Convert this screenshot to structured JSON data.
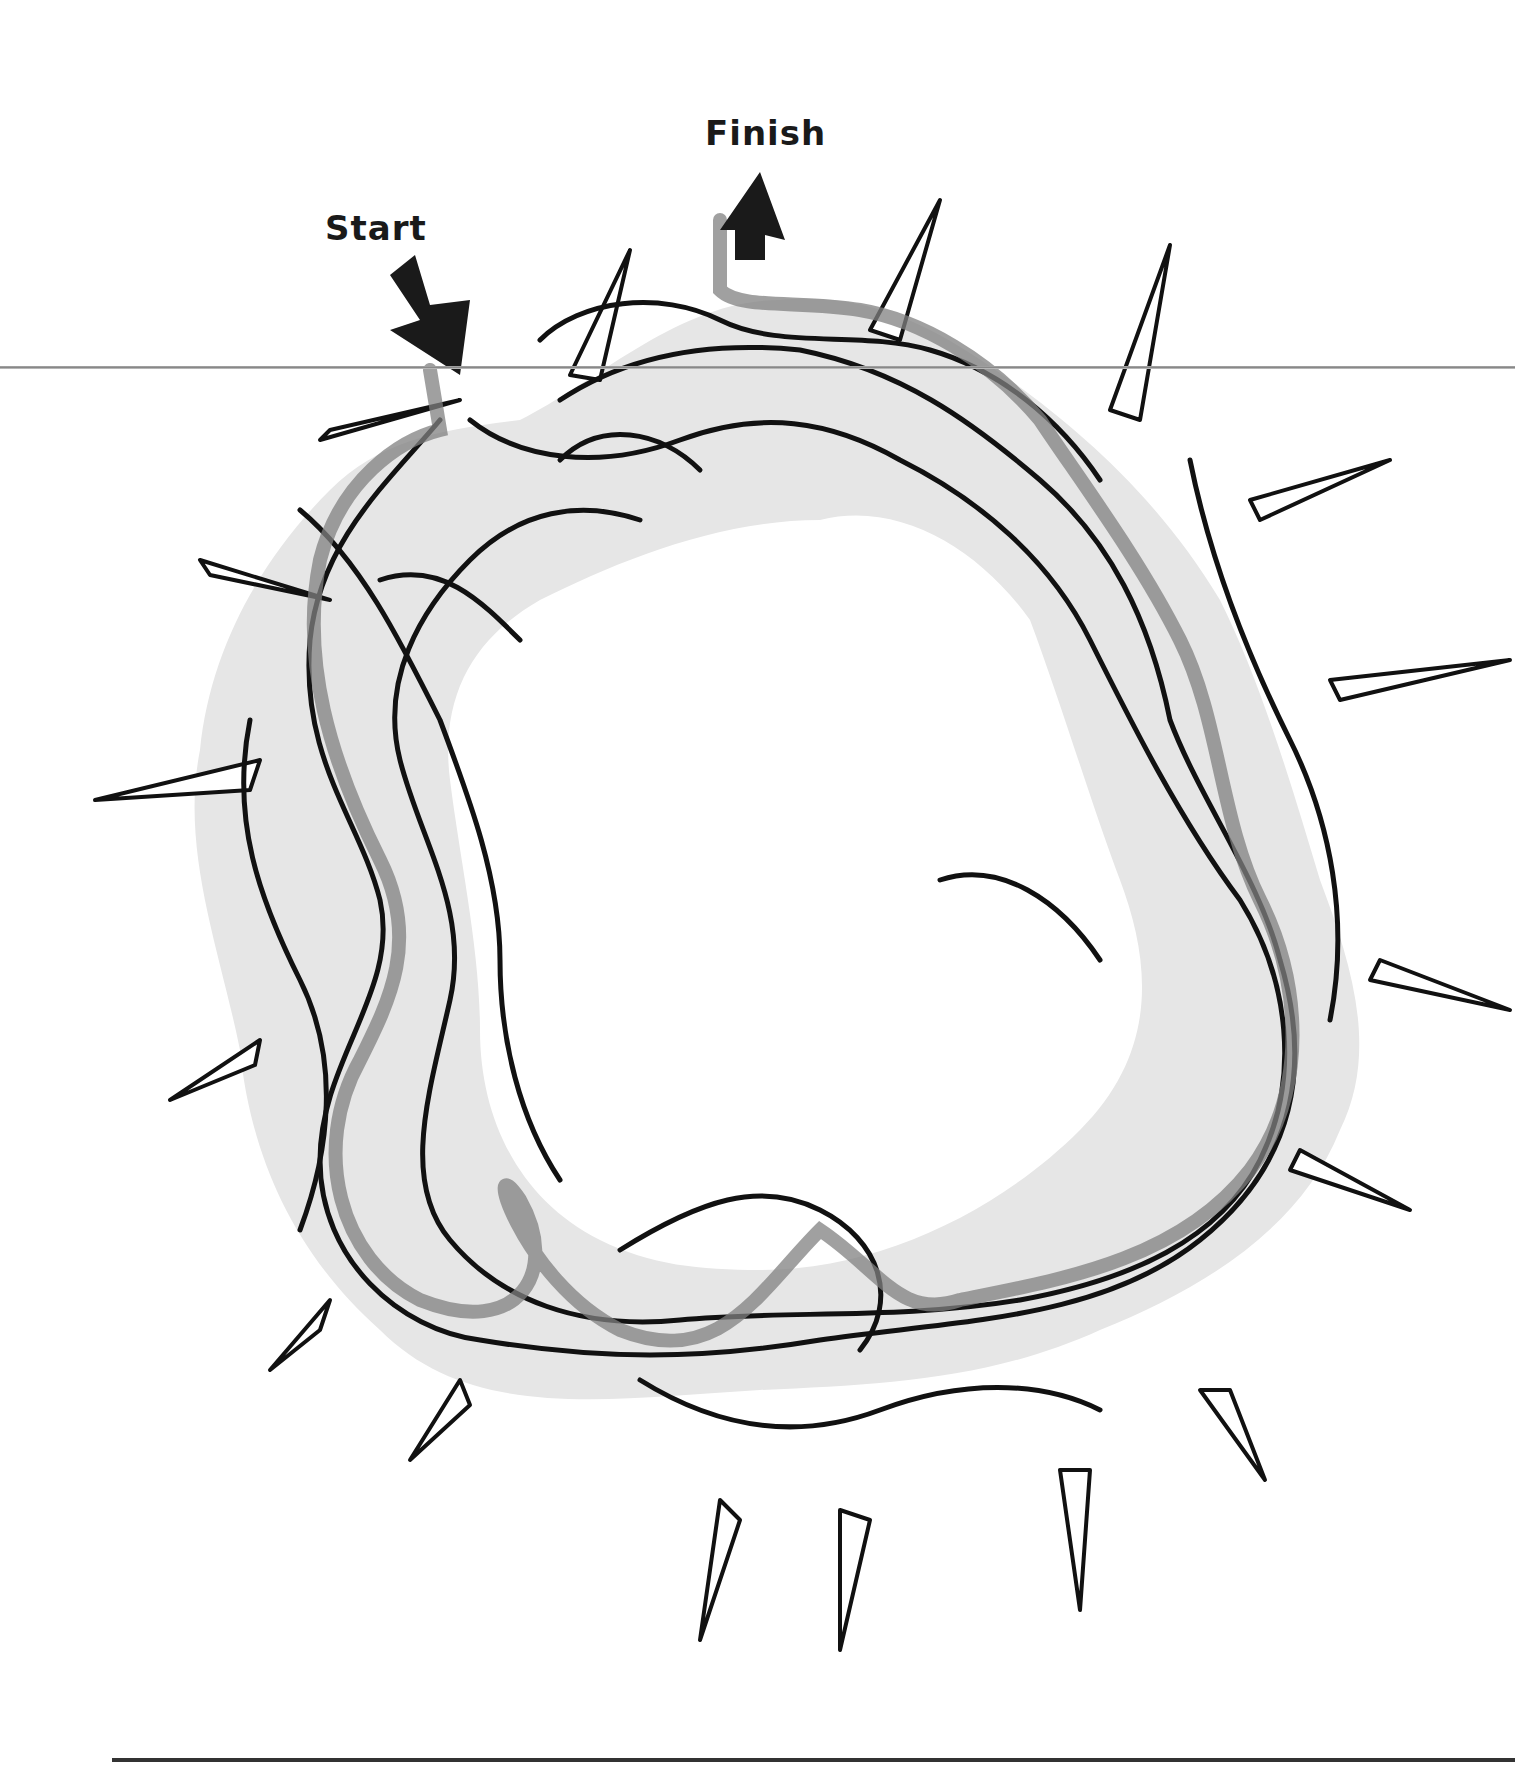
{
  "puzzle": {
    "type": "maze",
    "subject": "crown of thorns",
    "start_label": "Start",
    "finish_label": "Finish"
  },
  "colors": {
    "background": "#ffffff",
    "maze_fill": "#e6e6e6",
    "line": "#111111",
    "solution_path": "#808080",
    "arrow": "#1a1a1a"
  },
  "icons": {
    "start_arrow": "arrow-down-right-icon",
    "finish_arrow": "arrow-up-icon"
  }
}
